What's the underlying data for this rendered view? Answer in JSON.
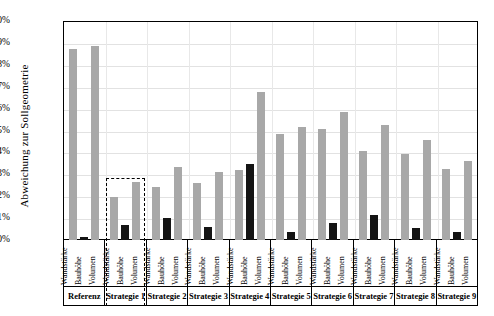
{
  "chart_data": {
    "type": "bar",
    "title": "",
    "xlabel": "",
    "ylabel": "Abweichung zur Sollgeometrie",
    "ylim": [
      0,
      10
    ],
    "y_unit": "%",
    "grid": true,
    "legend": null,
    "yticks": [
      "0%",
      "1%",
      "2%",
      "3%",
      "4%",
      "5%",
      "6%",
      "7%",
      "8%",
      "9%",
      "10%"
    ],
    "ytick_values": [
      0,
      1,
      2,
      3,
      4,
      5,
      6,
      7,
      8,
      9,
      10
    ],
    "categories": [
      "Referenz",
      "Strategie 1",
      "Strategie 2",
      "Strategie 3",
      "Strategie 4",
      "Strategie 5",
      "Strategie 6",
      "Strategie 7",
      "Strategie 8",
      "Strategie 9"
    ],
    "sub_categories": [
      "Wandstärke",
      "Bauhöhe",
      "Volumen"
    ],
    "series": [
      {
        "name": "Wandstärke",
        "color": "#a8a8a8",
        "values": [
          8.7,
          1.95,
          2.4,
          2.6,
          3.2,
          4.85,
          5.05,
          4.05,
          3.95,
          3.25
        ]
      },
      {
        "name": "Bauhöhe",
        "color": "#141414",
        "values": [
          0.12,
          0.7,
          1.0,
          0.58,
          3.45,
          0.35,
          0.78,
          1.15,
          0.55,
          0.35
        ]
      },
      {
        "name": "Volumen",
        "color": "#a8a8a8",
        "values": [
          8.85,
          2.65,
          3.35,
          3.1,
          6.75,
          5.15,
          5.85,
          5.25,
          4.55,
          3.6
        ]
      }
    ],
    "annotations": [
      {
        "type": "dashed-box",
        "label": "highlight-strategie-1",
        "target_category": "Strategie 1",
        "top_value": 2.85
      }
    ]
  }
}
